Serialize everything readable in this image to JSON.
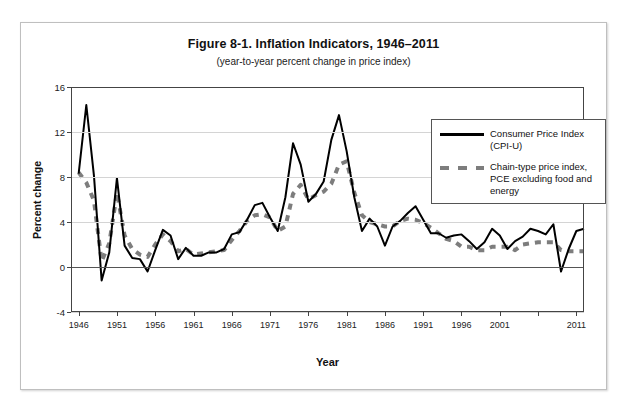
{
  "figure": {
    "title": "Figure 8-1. Inflation Indicators, 1946–2011",
    "subtitle": "(year-to-year percent change in price index)"
  },
  "axes": {
    "y_title": "Percent change",
    "x_title": "Year",
    "y_ticks": [
      "16",
      "12",
      "8",
      "4",
      "0",
      "-4"
    ],
    "x_ticks": [
      "1946",
      "1951",
      "1956",
      "1961",
      "1966",
      "1971",
      "1976",
      "1981",
      "1986",
      "1991",
      "1996",
      "2001",
      "",
      "2011"
    ]
  },
  "legend": {
    "items": [
      {
        "label": "Consumer Price Index (CPI-U)",
        "style": "solid",
        "color": "#000000"
      },
      {
        "label": "Chain-type price index, PCE excluding food and energy",
        "style": "dashed",
        "color": "#7d7d7d"
      }
    ]
  },
  "colors": {
    "cpi": "#000000",
    "pce": "#7d7d7d",
    "grid": "#d4d4d4",
    "axis": "#444444",
    "frame": "#bfbfbf"
  },
  "chart_data": {
    "type": "line",
    "title": "Figure 8-1. Inflation Indicators, 1946–2011",
    "subtitle": "(year-to-year percent change in price index)",
    "xlabel": "Year",
    "ylabel": "Percent change",
    "xlim": [
      1945,
      2012
    ],
    "ylim": [
      -4,
      16
    ],
    "yticks": [
      -4,
      0,
      4,
      8,
      12,
      16
    ],
    "xticks": [
      1946,
      1951,
      1956,
      1961,
      1966,
      1971,
      1976,
      1981,
      1986,
      1991,
      1996,
      2001,
      2006,
      2011
    ],
    "grid": "horizontal",
    "legend_position": "upper-right-inside",
    "x": [
      1946,
      1947,
      1948,
      1949,
      1950,
      1951,
      1952,
      1953,
      1954,
      1955,
      1956,
      1957,
      1958,
      1959,
      1960,
      1961,
      1962,
      1963,
      1964,
      1965,
      1966,
      1967,
      1968,
      1969,
      1970,
      1971,
      1972,
      1973,
      1974,
      1975,
      1976,
      1977,
      1978,
      1979,
      1980,
      1981,
      1982,
      1983,
      1984,
      1985,
      1986,
      1987,
      1988,
      1989,
      1990,
      1991,
      1992,
      1993,
      1994,
      1995,
      1996,
      1997,
      1998,
      1999,
      2000,
      2001,
      2002,
      2003,
      2004,
      2005,
      2006,
      2007,
      2008,
      2009,
      2010,
      2011,
      2012
    ],
    "series": [
      {
        "name": "Consumer Price Index (CPI-U)",
        "style": "solid",
        "color": "#000000",
        "values": [
          8.3,
          14.4,
          8.1,
          -1.2,
          1.3,
          7.9,
          1.9,
          0.8,
          0.7,
          -0.4,
          1.5,
          3.3,
          2.8,
          0.7,
          1.7,
          1.0,
          1.0,
          1.3,
          1.3,
          1.6,
          2.9,
          3.1,
          4.2,
          5.5,
          5.7,
          4.4,
          3.2,
          6.2,
          11.0,
          9.1,
          5.8,
          6.5,
          7.6,
          11.3,
          13.5,
          10.3,
          6.2,
          3.2,
          4.3,
          3.6,
          1.9,
          3.6,
          4.1,
          4.8,
          5.4,
          4.2,
          3.0,
          3.0,
          2.6,
          2.8,
          2.9,
          2.3,
          1.6,
          2.2,
          3.4,
          2.8,
          1.6,
          2.3,
          2.7,
          3.4,
          3.2,
          2.9,
          3.8,
          -0.4,
          1.6,
          3.2,
          3.4
        ]
      },
      {
        "name": "Chain-type price index, PCE excluding food and energy",
        "style": "dashed",
        "color": "#7d7d7d",
        "values": [
          8.4,
          7.5,
          5.9,
          0.5,
          2.1,
          6.6,
          2.8,
          1.6,
          1.1,
          0.9,
          2.0,
          2.9,
          2.3,
          1.4,
          1.6,
          1.1,
          1.2,
          1.3,
          1.4,
          1.5,
          2.4,
          3.2,
          4.1,
          4.6,
          4.7,
          4.4,
          3.2,
          3.6,
          6.5,
          7.3,
          6.0,
          6.4,
          6.7,
          7.4,
          9.1,
          9.4,
          6.6,
          4.6,
          4.0,
          3.8,
          3.6,
          3.6,
          4.1,
          4.3,
          4.2,
          3.9,
          3.5,
          3.0,
          2.5,
          2.3,
          1.8,
          1.8,
          1.5,
          1.5,
          1.8,
          1.8,
          1.8,
          1.5,
          2.0,
          2.1,
          2.2,
          2.2,
          2.2,
          1.5,
          1.4,
          1.4,
          1.4
        ]
      }
    ]
  }
}
